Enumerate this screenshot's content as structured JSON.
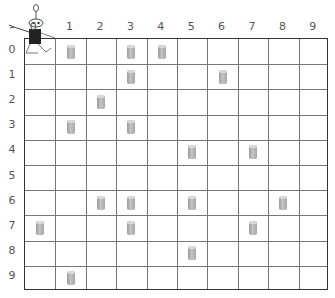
{
  "game": {
    "name": "Robby the soda-can-collecting robot grid",
    "grid_size": 10,
    "column_labels": [
      "0",
      "1",
      "2",
      "3",
      "4",
      "5",
      "6",
      "7",
      "8",
      "9"
    ],
    "row_labels": [
      "0",
      "1",
      "2",
      "3",
      "4",
      "5",
      "6",
      "7",
      "8",
      "9"
    ],
    "robot": {
      "row": 0,
      "col": 0,
      "icon": "robot-icon"
    },
    "cans": [
      {
        "row": 0,
        "col": 1
      },
      {
        "row": 0,
        "col": 3
      },
      {
        "row": 0,
        "col": 4
      },
      {
        "row": 1,
        "col": 3
      },
      {
        "row": 1,
        "col": 6
      },
      {
        "row": 2,
        "col": 2
      },
      {
        "row": 3,
        "col": 1
      },
      {
        "row": 3,
        "col": 3
      },
      {
        "row": 4,
        "col": 5
      },
      {
        "row": 4,
        "col": 7
      },
      {
        "row": 6,
        "col": 2
      },
      {
        "row": 6,
        "col": 3
      },
      {
        "row": 6,
        "col": 5
      },
      {
        "row": 6,
        "col": 8
      },
      {
        "row": 7,
        "col": 0
      },
      {
        "row": 7,
        "col": 3
      },
      {
        "row": 7,
        "col": 7
      },
      {
        "row": 8,
        "col": 5
      },
      {
        "row": 9,
        "col": 1
      }
    ],
    "colors": {
      "grid": "#777777",
      "border": "#333333",
      "can": "#b0b0b0",
      "robot_body": "#222222"
    }
  }
}
